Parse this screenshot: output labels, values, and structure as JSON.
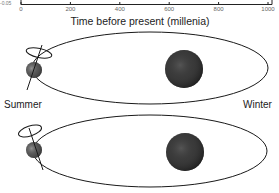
{
  "chart_data": {
    "type": "line",
    "title": "",
    "xlabel": "Time before present (millenia)",
    "ylabel": "",
    "x_ticks": [
      0,
      200,
      400,
      600,
      800,
      1000
    ],
    "x_tick_labels": [
      "0",
      "200",
      "400",
      "600",
      "800",
      "1000"
    ],
    "xlim": [
      0,
      1000
    ],
    "y_tick_labels_visible": [
      "-0.05"
    ],
    "note": "Only the bottom x-axis of the chart is visible; plotted series are cropped out of view.",
    "series": []
  },
  "diagram": {
    "labels": {
      "left": "Summer",
      "right": "Winter"
    },
    "panels": [
      {
        "name": "orbit-top",
        "sun": "sun",
        "planet": "earth",
        "axis": "tilted-axis-with-precession-circle"
      },
      {
        "name": "orbit-bottom",
        "sun": "sun",
        "planet": "earth",
        "axis": "tilted-axis-with-precession-circle"
      }
    ]
  },
  "colors": {
    "line": "#1a1a1a",
    "text": "#222222",
    "sun": "#3a3a3a",
    "earth": "#555555"
  }
}
